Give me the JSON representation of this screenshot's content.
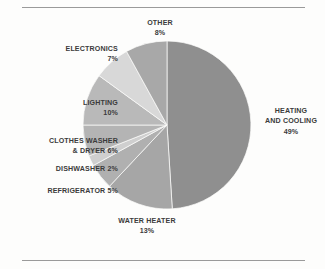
{
  "chart_data": {
    "type": "pie",
    "title": "",
    "subtitle": "",
    "xlabel": "",
    "ylabel": "",
    "legend_position": "none",
    "grid": false,
    "units": "percent",
    "total": 100,
    "categories": [
      "HEATING AND COOLING",
      "WATER HEATER",
      "REFRIGERATOR",
      "DISHWASHER",
      "CLOTHES WASHER & DRYER",
      "LIGHTING",
      "ELECTRONICS",
      "OTHER"
    ],
    "values": [
      49,
      13,
      5,
      2,
      6,
      10,
      7,
      8
    ],
    "slices": [
      {
        "name": "HEATING AND COOLING",
        "label_line1": "HEATING",
        "label_line2": "AND COOLING",
        "value": 49,
        "percent_text": "49%",
        "color": "#8f8f8f",
        "start_deg": 0,
        "end_deg": 176.4
      },
      {
        "name": "WATER HEATER",
        "label_line1": "WATER HEATER",
        "label_line2": "",
        "value": 13,
        "percent_text": "13%",
        "color": "#a6a6a6",
        "start_deg": 176.4,
        "end_deg": 223.2
      },
      {
        "name": "REFRIGERATOR",
        "label_line1": "REFRIGERATOR 5%",
        "label_line2": "",
        "value": 5,
        "percent_text": "5%",
        "color": "#b0b0b0",
        "start_deg": 223.2,
        "end_deg": 241.2
      },
      {
        "name": "DISHWASHER",
        "label_line1": "DISHWASHER 2%",
        "label_line2": "",
        "value": 2,
        "percent_text": "2%",
        "color": "#cfcfcf",
        "start_deg": 241.2,
        "end_deg": 248.4
      },
      {
        "name": "CLOTHES WASHER & DRYER",
        "label_line1": "CLOTHES WASHER",
        "label_line2": "& DRYER 6%",
        "value": 6,
        "percent_text": "6%",
        "color": "#b4b4b4",
        "start_deg": 248.4,
        "end_deg": 270.0
      },
      {
        "name": "LIGHTING",
        "label_line1": "LIGHTING",
        "label_line2": "",
        "value": 10,
        "percent_text": "10%",
        "color": "#b9b9b9",
        "start_deg": 270.0,
        "end_deg": 306.0
      },
      {
        "name": "ELECTRONICS",
        "label_line1": "ELECTRONICS",
        "label_line2": "",
        "value": 7,
        "percent_text": "7%",
        "color": "#d8d8d8",
        "start_deg": 306.0,
        "end_deg": 331.2
      },
      {
        "name": "OTHER",
        "label_line1": "OTHER",
        "label_line2": "",
        "value": 8,
        "percent_text": "8%",
        "color": "#a8a8a8",
        "start_deg": 331.2,
        "end_deg": 360.0
      }
    ]
  },
  "labels": {
    "other": {
      "name": "OTHER",
      "percent": "8%"
    },
    "electronics": {
      "name": "ELECTRONICS",
      "percent": "7%"
    },
    "lighting": {
      "name": "LIGHTING",
      "percent": "10%"
    },
    "clothes_washer": {
      "line1": "CLOTHES WASHER",
      "line2": "& DRYER 6%"
    },
    "dishwasher": {
      "line1": "DISHWASHER 2%"
    },
    "refrigerator": {
      "line1": "REFRIGERATOR 5%"
    },
    "water_heater": {
      "name": "WATER HEATER",
      "percent": "13%"
    },
    "heating_cooling": {
      "line1": "HEATING",
      "line2": "AND COOLING",
      "percent": "49%"
    }
  },
  "colors": {
    "background": "#fdfdfc",
    "rule": "#9a9a9a",
    "text": "#3b3b3b"
  }
}
